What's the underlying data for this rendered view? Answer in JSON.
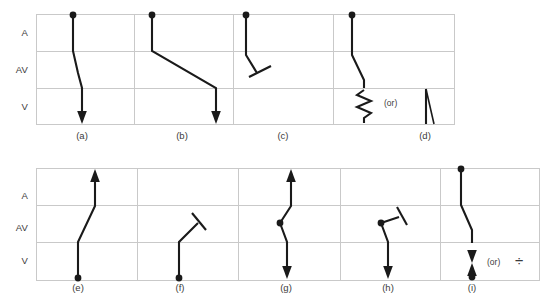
{
  "figure": {
    "type": "ladder-diagram",
    "row_labels": [
      "A",
      "AV",
      "V"
    ],
    "grid_color": "#c9c9c9",
    "trace_color": "#1a1a1a",
    "background": "#ffffff"
  },
  "top_row": {
    "rows": [
      {
        "name": "A",
        "label": "A"
      },
      {
        "name": "AV",
        "label": "AV"
      },
      {
        "name": "V",
        "label": "V"
      }
    ],
    "panels": [
      {
        "id": "a",
        "caption": "(a)",
        "note": ""
      },
      {
        "id": "b",
        "caption": "(b)",
        "note": ""
      },
      {
        "id": "c",
        "caption": "(c)",
        "note": ""
      },
      {
        "id": "d",
        "caption": "(d)",
        "note": "(or)"
      }
    ]
  },
  "bottom_row": {
    "rows": [
      {
        "name": "A",
        "label": "A"
      },
      {
        "name": "AV",
        "label": "AV"
      },
      {
        "name": "V",
        "label": "V"
      }
    ],
    "panels": [
      {
        "id": "e",
        "caption": "(e)",
        "note": ""
      },
      {
        "id": "f",
        "caption": "(f)",
        "note": ""
      },
      {
        "id": "g",
        "caption": "(g)",
        "note": ""
      },
      {
        "id": "h",
        "caption": "(h)",
        "note": ""
      },
      {
        "id": "i",
        "caption": "(i)",
        "note": "(or)"
      }
    ]
  },
  "symbols": {
    "block_bar": "block-bar",
    "slow_conduction": "zigzag",
    "divide_symbol": "÷",
    "origin_dot": "filled-circle",
    "arrowhead": "filled-triangle"
  }
}
